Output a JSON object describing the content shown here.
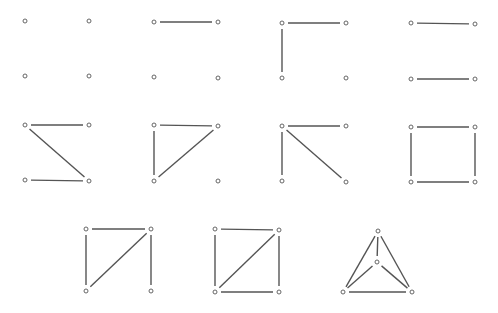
{
  "diagram": {
    "title": "",
    "colors": {
      "edge": "#555555",
      "node_stroke": "#666666",
      "node_fill": "#ffffff",
      "background": "#ffffff"
    },
    "node_radius": 2,
    "edge_gap": 6,
    "graphs": [
      {
        "id": "g1",
        "edges_count": 0,
        "nodes": [
          [
            25,
            21
          ],
          [
            89,
            21
          ],
          [
            25,
            76
          ],
          [
            89,
            76
          ]
        ],
        "edges": []
      },
      {
        "id": "g2",
        "edges_count": 1,
        "nodes": [
          [
            154,
            22
          ],
          [
            218,
            22
          ],
          [
            154,
            77
          ],
          [
            218,
            78
          ]
        ],
        "edges": [
          [
            0,
            1
          ]
        ]
      },
      {
        "id": "g3",
        "edges_count": 2,
        "nodes": [
          [
            282,
            23
          ],
          [
            346,
            23
          ],
          [
            282,
            78
          ],
          [
            346,
            78
          ]
        ],
        "edges": [
          [
            0,
            1
          ],
          [
            0,
            2
          ]
        ]
      },
      {
        "id": "g4",
        "edges_count": 2,
        "nodes": [
          [
            411,
            23
          ],
          [
            475,
            24
          ],
          [
            411,
            79
          ],
          [
            475,
            79
          ]
        ],
        "edges": [
          [
            0,
            1
          ],
          [
            2,
            3
          ]
        ]
      },
      {
        "id": "g5",
        "edges_count": 3,
        "nodes": [
          [
            25,
            125
          ],
          [
            89,
            125
          ],
          [
            25,
            180
          ],
          [
            89,
            181
          ]
        ],
        "edges": [
          [
            0,
            1
          ],
          [
            0,
            3
          ],
          [
            2,
            3
          ]
        ]
      },
      {
        "id": "g6",
        "edges_count": 3,
        "nodes": [
          [
            154,
            125
          ],
          [
            218,
            126
          ],
          [
            154,
            181
          ],
          [
            218,
            181
          ]
        ],
        "edges": [
          [
            0,
            1
          ],
          [
            0,
            2
          ],
          [
            1,
            2
          ]
        ]
      },
      {
        "id": "g7",
        "edges_count": 3,
        "nodes": [
          [
            282,
            126
          ],
          [
            346,
            126
          ],
          [
            282,
            181
          ],
          [
            346,
            182
          ]
        ],
        "edges": [
          [
            0,
            1
          ],
          [
            0,
            2
          ],
          [
            0,
            3
          ]
        ]
      },
      {
        "id": "g8",
        "edges_count": 4,
        "nodes": [
          [
            411,
            127
          ],
          [
            475,
            127
          ],
          [
            411,
            182
          ],
          [
            475,
            182
          ]
        ],
        "edges": [
          [
            0,
            1
          ],
          [
            0,
            2
          ],
          [
            1,
            3
          ],
          [
            2,
            3
          ]
        ]
      },
      {
        "id": "g9",
        "edges_count": 4,
        "nodes": [
          [
            86,
            229
          ],
          [
            151,
            229
          ],
          [
            86,
            291
          ],
          [
            151,
            291
          ]
        ],
        "edges": [
          [
            0,
            1
          ],
          [
            0,
            2
          ],
          [
            1,
            2
          ],
          [
            1,
            3
          ]
        ]
      },
      {
        "id": "g10",
        "edges_count": 5,
        "nodes": [
          [
            215,
            229
          ],
          [
            279,
            230
          ],
          [
            215,
            292
          ],
          [
            279,
            292
          ]
        ],
        "edges": [
          [
            0,
            1
          ],
          [
            0,
            2
          ],
          [
            1,
            2
          ],
          [
            1,
            3
          ],
          [
            2,
            3
          ]
        ]
      },
      {
        "id": "g11",
        "edges_count": 6,
        "nodes": [
          [
            378,
            231
          ],
          [
            377,
            262
          ],
          [
            343,
            292
          ],
          [
            412,
            292
          ]
        ],
        "edges": [
          [
            0,
            1
          ],
          [
            0,
            2
          ],
          [
            0,
            3
          ],
          [
            1,
            2
          ],
          [
            1,
            3
          ],
          [
            2,
            3
          ]
        ]
      }
    ]
  }
}
